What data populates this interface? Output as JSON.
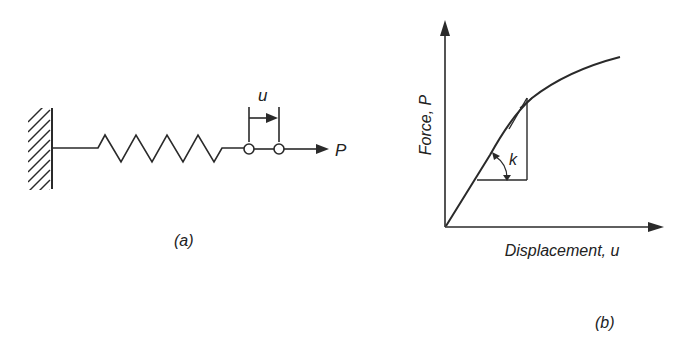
{
  "figure_a": {
    "label": "(a)",
    "displacement_label": "u",
    "force_label": "P",
    "components": [
      "fixed-wall",
      "spring",
      "node-1",
      "node-2",
      "force-arrow",
      "displacement-bracket"
    ]
  },
  "figure_b": {
    "label": "(b)",
    "y_axis_label": "Force, P",
    "x_axis_label": "Displacement, u",
    "slope_label": "k"
  },
  "colors": {
    "stroke": "#2a2a2a",
    "background": "#ffffff"
  }
}
